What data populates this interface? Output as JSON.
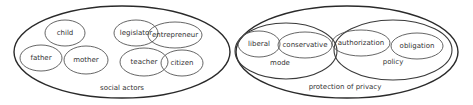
{
  "diagram": {
    "left": {
      "label": "social actors",
      "nodes": [
        {
          "label": "child"
        },
        {
          "label": "legislator"
        },
        {
          "label": "entrepreneur"
        },
        {
          "label": "father"
        },
        {
          "label": "mother"
        },
        {
          "label": "teacher"
        },
        {
          "label": "citizen"
        }
      ]
    },
    "right": {
      "label": "protection of privacy",
      "groups": [
        {
          "label": "mode",
          "nodes": [
            {
              "label": "liberal"
            },
            {
              "label": "conservative"
            }
          ]
        },
        {
          "label": "policy",
          "nodes": [
            {
              "label": "authorization"
            },
            {
              "label": "obligation"
            }
          ]
        }
      ]
    }
  }
}
